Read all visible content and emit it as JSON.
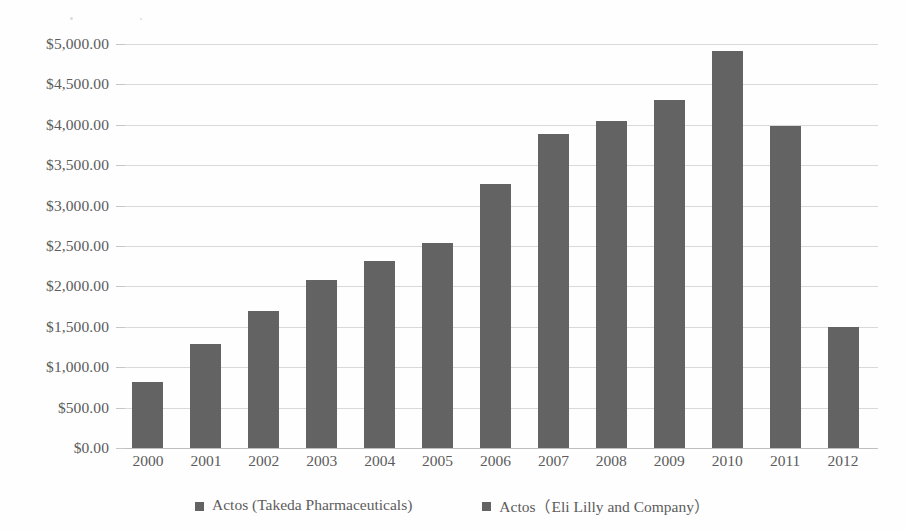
{
  "chart_data": {
    "type": "bar",
    "title": "",
    "xlabel": "",
    "ylabel": "",
    "categories": [
      "2000",
      "2001",
      "2002",
      "2003",
      "2004",
      "2005",
      "2006",
      "2007",
      "2008",
      "2009",
      "2010",
      "2011",
      "2012"
    ],
    "series": [
      {
        "name": "Actos (Takeda Pharmaceuticals)",
        "color": "#636363",
        "values": [
          820,
          1290,
          1700,
          2080,
          2310,
          2540,
          3270,
          3885,
          4050,
          4310,
          4915,
          3990,
          1500
        ]
      }
    ],
    "ylim": [
      0,
      5000
    ],
    "ytick_values": [
      0,
      500,
      1000,
      1500,
      2000,
      2500,
      3000,
      3500,
      4000,
      4500,
      5000
    ],
    "ytick_labels": [
      "$0.00",
      "$500.00",
      "$1,000.00",
      "$1,500.00",
      "$2,000.00",
      "$2,500.00",
      "$3,000.00",
      "$3,500.00",
      "$4,000.00",
      "$4,500.00",
      "$5,000.00"
    ],
    "grid": true,
    "legend_position": "bottom",
    "legend": [
      {
        "label": "Actos (Takeda Pharmaceuticals)",
        "color": "#636363",
        "marker": "square"
      },
      {
        "label": "Actos（Eli Lilly and Company）",
        "color": "#636363",
        "marker": "square"
      }
    ]
  }
}
